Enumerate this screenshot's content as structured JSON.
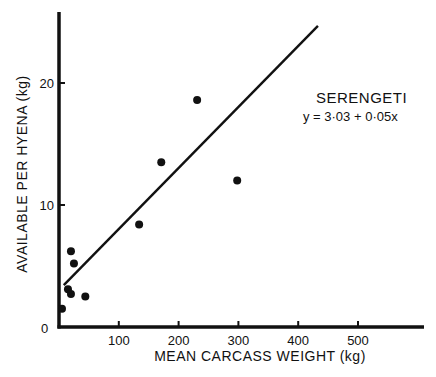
{
  "chart_data": {
    "type": "scatter",
    "title": "",
    "xlabel": "MEAN CARCASS WEIGHT (kg)",
    "ylabel": "AVAILABLE PER HYENA (kg)",
    "xlim": [
      0,
      600
    ],
    "ylim": [
      0,
      26
    ],
    "x_ticks": [
      100,
      200,
      300,
      400,
      500
    ],
    "x_tick_labels": [
      "100",
      "200",
      "300",
      "400",
      "500"
    ],
    "y_ticks": [
      0,
      10,
      20
    ],
    "y_tick_labels": [
      "0",
      "10",
      "20"
    ],
    "grid": false,
    "legend": null,
    "series": [
      {
        "name": "Serengeti",
        "points": [
          {
            "x": 5,
            "y": 1.5
          },
          {
            "x": 15,
            "y": 3.1
          },
          {
            "x": 20,
            "y": 2.7
          },
          {
            "x": 20,
            "y": 6.2
          },
          {
            "x": 25,
            "y": 5.2
          },
          {
            "x": 44,
            "y": 2.5
          },
          {
            "x": 134,
            "y": 8.4
          },
          {
            "x": 171,
            "y": 13.5
          },
          {
            "x": 231,
            "y": 18.6
          },
          {
            "x": 298,
            "y": 12.0
          }
        ]
      }
    ],
    "regression_line": {
      "intercept": 3.03,
      "slope": 0.05,
      "x_start": 8,
      "x_end": 433
    },
    "annotations": [
      {
        "text": "SERENGETI"
      },
      {
        "text": "y = 3·03 + 0·05x"
      }
    ]
  },
  "labels": {
    "xlabel": "MEAN CARCASS WEIGHT (kg)",
    "ylabel": "AVAILABLE PER HYENA (kg)",
    "x0": "0",
    "annotation_title": "SERENGETI",
    "annotation_equation": "y = 3·03 + 0·05x"
  }
}
